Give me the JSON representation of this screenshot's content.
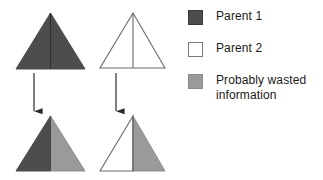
{
  "figure": {
    "background_color": "#ffffff"
  },
  "colors": {
    "parent1": "#4d4d4d",
    "parent2": "#ffffff",
    "wasted": "#9a9a9a",
    "outline": "#4d4d4d",
    "arrow": "#2b2b2b",
    "text": "#1a1a1a"
  },
  "legend": {
    "items": [
      {
        "id": "parent-1",
        "label": "Parent 1",
        "swatch": "solid-dark-square-icon",
        "color": "#4d4d4d"
      },
      {
        "id": "parent-2",
        "label": "Parent 2",
        "swatch": "outlined-white-square-icon",
        "color": "#ffffff"
      },
      {
        "id": "wasted-information",
        "label": "Probably wasted",
        "label_line2": "information",
        "swatch": "solid-gray-square-icon",
        "color": "#9a9a9a"
      }
    ]
  },
  "diagram": {
    "parents": [
      {
        "id": "parent-1-triangle",
        "name": "Parent 1 triangle",
        "fill": "#4d4d4d",
        "apex": [
          50.5,
          13
        ],
        "base_left": [
          16,
          69
        ],
        "base_right": [
          85,
          69
        ],
        "midline_x": 50.5
      },
      {
        "id": "parent-2-triangle",
        "name": "Parent 2 triangle",
        "fill": "#ffffff",
        "apex": [
          133,
          13
        ],
        "base_left": [
          100,
          68
        ],
        "base_right": [
          165,
          68
        ],
        "midline_x": 133
      }
    ],
    "arrows": [
      {
        "id": "arrow-left",
        "name": "downward arrow left",
        "x": 34,
        "y_start": 73,
        "y_end": 111
      },
      {
        "id": "arrow-right",
        "name": "downward arrow right",
        "x": 116,
        "y_start": 73,
        "y_end": 111
      }
    ],
    "offspring": [
      {
        "id": "offspring-1-triangle",
        "name": "Offspring 1 triangle",
        "left_half_fill": "#4d4d4d",
        "right_half_fill": "#9a9a9a",
        "apex": [
          50.5,
          116
        ],
        "base_left": [
          16,
          171
        ],
        "base_right": [
          85,
          171
        ],
        "midline_x": 50.5
      },
      {
        "id": "offspring-2-triangle",
        "name": "Offspring 2 triangle",
        "left_half_fill": "#ffffff",
        "right_half_fill": "#9a9a9a",
        "apex": [
          133,
          116
        ],
        "base_left": [
          100,
          171
        ],
        "base_right": [
          165,
          171
        ],
        "midline_x": 133
      }
    ]
  }
}
